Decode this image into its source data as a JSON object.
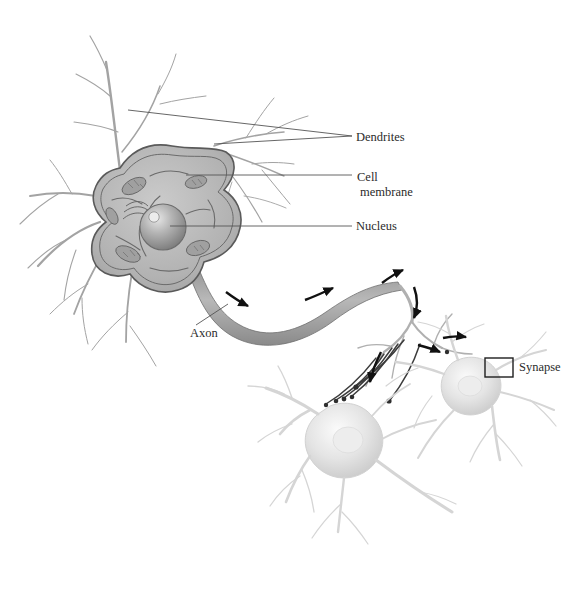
{
  "figure": {
    "background_color": "#ffffff",
    "ink_color": "#2b2b2b"
  },
  "labels": {
    "dendrites": "Dendrites",
    "cell_membrane_line1": "Cell",
    "cell_membrane_line2": "membrane",
    "nucleus": "Nucleus",
    "axon": "Axon",
    "synapse": "Synapse"
  },
  "parts": {
    "soma": "cell-body-soma",
    "nucleus": "nucleus-sphere",
    "nucleolus": "nucleolus",
    "axon": "axon-fiber",
    "axon_terminal": "axon-terminal-branches",
    "dendrite_tree": "dendrite-branches",
    "target_neuron_left": "postsynaptic-neuron-left",
    "target_neuron_right": "postsynaptic-neuron-right",
    "synapse_box": "synapse-callout-box",
    "signal_arrows": "signal-direction-arrows"
  },
  "colors": {
    "soma_fill": "#b9b9b9",
    "soma_edge": "#5a5a5a",
    "nucleus_fill": "#9a9a9a",
    "axon_fill": "#a8a8a8",
    "dendrite_stroke": "#9e9e9e",
    "pale_neuron": "#dcdcdc",
    "arrow_color": "#111111",
    "leader_line": "#555555"
  },
  "arrow_count": 6,
  "leaders": [
    {
      "name": "dendrites-upper",
      "from": [
        128,
        110
      ],
      "to": [
        352,
        136
      ]
    },
    {
      "name": "dendrites-lower",
      "from": [
        214,
        144
      ],
      "to": [
        352,
        136
      ]
    },
    {
      "name": "cell-membrane",
      "from": [
        186,
        175
      ],
      "to": [
        352,
        175
      ]
    },
    {
      "name": "nucleus",
      "from": [
        170,
        226
      ],
      "to": [
        352,
        226
      ]
    },
    {
      "name": "axon",
      "from": [
        228,
        304
      ],
      "to": [
        196,
        325
      ]
    }
  ]
}
